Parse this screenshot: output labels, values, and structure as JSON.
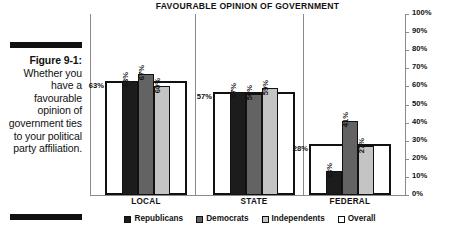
{
  "caption": {
    "figure_label": "Figure 9-1:",
    "text": "Whether you have a favourable opinion of government ties to your political party affiliation."
  },
  "chart_data": {
    "type": "bar",
    "title": "FAVOURABLE OPINION OF GOVERNMENT",
    "xlabel": "",
    "ylabel": "",
    "ylim": [
      0,
      100
    ],
    "ytick_labels": [
      "100%",
      "90%",
      "80%",
      "70%",
      "60%",
      "50%",
      "40%",
      "30%",
      "20%",
      "10%",
      "0%"
    ],
    "ytick_values": [
      100,
      90,
      80,
      70,
      60,
      50,
      40,
      30,
      20,
      10,
      0
    ],
    "grid": false,
    "legend_position": "bottom",
    "categories": [
      "LOCAL",
      "STATE",
      "FEDERAL"
    ],
    "series": [
      {
        "name": "Republicans",
        "color": "#1c1c1c",
        "values": [
          63,
          57,
          13
        ],
        "labels": [
          "63%",
          "57%",
          "13%"
        ]
      },
      {
        "name": "Democrats",
        "color": "#636363",
        "values": [
          67,
          56,
          41
        ],
        "labels": [
          "67%",
          "56%",
          "41%"
        ]
      },
      {
        "name": "Independents",
        "color": "#c4c4c4",
        "values": [
          60,
          59,
          27
        ],
        "labels": [
          "60%",
          "59%",
          "27%"
        ]
      },
      {
        "name": "Overall",
        "color": "#ffffff",
        "values": [
          63,
          57,
          28
        ],
        "labels": [
          "63%",
          "57%",
          "28%"
        ]
      }
    ]
  }
}
